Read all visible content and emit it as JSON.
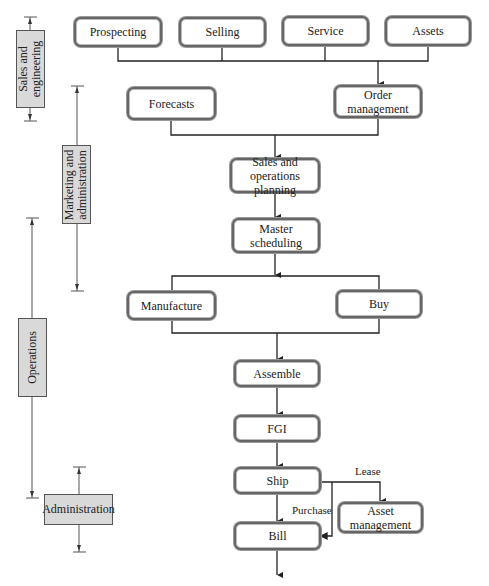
{
  "diagram": {
    "boxes": {
      "prospecting": "Prospecting",
      "selling": "Selling",
      "service": "Service",
      "assets": "Assets",
      "forecasts": "Forecasts",
      "order_management_1": "Order",
      "order_management_2": "management",
      "sop_1": "Sales and",
      "sop_2": "operations planning",
      "master_1": "Master",
      "master_2": "scheduling",
      "manufacture": "Manufacture",
      "buy": "Buy",
      "assemble": "Assemble",
      "fgi": "FGI",
      "ship": "Ship",
      "asset_mgmt_1": "Asset",
      "asset_mgmt_2": "management",
      "bill": "Bill"
    },
    "edge_labels": {
      "lease": "Lease",
      "purchase": "Purchase"
    },
    "bands": {
      "sales_1": "Sales and",
      "sales_2": "engineering",
      "marketing_1": "Marketing and",
      "marketing_2": "administration",
      "operations": "Operations",
      "administration": "Administration"
    },
    "colors": {
      "band_fill": "#d9d9d9",
      "box_border": "#666666",
      "line": "#222222"
    }
  }
}
